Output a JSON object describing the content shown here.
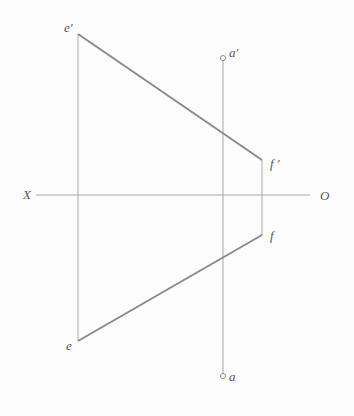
{
  "diagram": {
    "type": "descriptive-geometry-projection",
    "colors": {
      "background": "#fdfdfd",
      "thick_line": "#8a8a8a",
      "thin_line": "#a8a8a8",
      "label": "#555555"
    },
    "axis": {
      "left_label": "X",
      "right_label": "O",
      "y": 195,
      "x1": 36,
      "x2": 310
    },
    "points": {
      "e_prime": {
        "label": "e′",
        "x": 78,
        "y": 34
      },
      "f_prime": {
        "label": "f ′",
        "x": 262,
        "y": 160
      },
      "f": {
        "label": "f",
        "x": 262,
        "y": 235
      },
      "e": {
        "label": "e",
        "x": 78,
        "y": 341
      },
      "a_prime": {
        "label": "a′",
        "x": 223,
        "y": 58
      },
      "a": {
        "label": "a",
        "x": 223,
        "y": 376
      }
    },
    "segments": [
      {
        "name": "ef-front-view",
        "from": "e_prime",
        "to": "f_prime",
        "weight": "thick"
      },
      {
        "name": "ef-top-view",
        "from": "e",
        "to": "f",
        "weight": "thick"
      },
      {
        "name": "e-projection-line",
        "from": "e_prime",
        "to": "e",
        "weight": "thin"
      },
      {
        "name": "f-projection-line",
        "from": "f_prime",
        "to": "f",
        "weight": "thin"
      },
      {
        "name": "a-projection-line",
        "from": "a_prime",
        "to": "a",
        "weight": "thin"
      }
    ]
  }
}
